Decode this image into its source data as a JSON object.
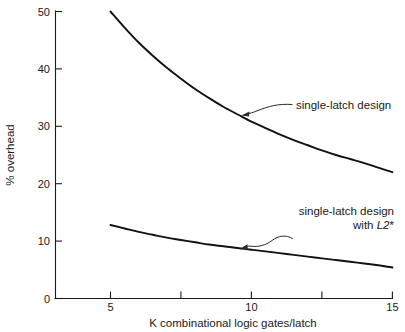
{
  "chart_data": {
    "type": "line",
    "title": "",
    "subtitle": "",
    "xlabel": "K combinational logic gates/latch",
    "ylabel": "% overhead",
    "xlim": [
      3.05,
      15
    ],
    "ylim": [
      0,
      50
    ],
    "grid": false,
    "legend_position": "inline-annotations",
    "x_ticks": [
      5,
      7.5,
      10,
      12.5,
      15
    ],
    "x_tick_labels": [
      "5",
      "",
      "10",
      "",
      "15"
    ],
    "y_ticks": [
      0,
      10,
      20,
      30,
      40,
      50
    ],
    "y_tick_labels": [
      "0",
      "10",
      "20",
      "30",
      "40",
      "50"
    ],
    "series": [
      {
        "name": "single-latch design",
        "x": [
          5,
          5.5,
          6,
          6.5,
          7,
          7.5,
          8,
          8.5,
          9,
          9.5,
          10,
          10.5,
          11,
          11.5,
          12,
          12.5,
          13,
          13.5,
          14,
          14.5,
          15
        ],
        "values": [
          50.0,
          47.2,
          44.6,
          42.3,
          40.2,
          38.3,
          36.5,
          34.9,
          33.4,
          32.1,
          30.8,
          29.7,
          28.6,
          27.6,
          26.7,
          25.8,
          25.0,
          24.3,
          23.6,
          22.8,
          22.0
        ]
      },
      {
        "name": "single-latch design with L2*",
        "x": [
          5,
          5.5,
          6,
          6.5,
          7,
          7.5,
          8,
          8.5,
          9,
          9.5,
          10,
          10.5,
          11,
          11.5,
          12,
          12.5,
          13,
          13.5,
          14,
          14.5,
          15
        ],
        "values": [
          12.8,
          12.2,
          11.6,
          11.1,
          10.6,
          10.2,
          9.8,
          9.4,
          9.1,
          8.8,
          8.5,
          8.2,
          7.9,
          7.6,
          7.3,
          7.0,
          6.7,
          6.4,
          6.1,
          5.8,
          5.4
        ]
      }
    ],
    "annotations": [
      {
        "id": "upper",
        "text": "single-latch design",
        "text_lines": [
          "single-latch design"
        ],
        "points_to": {
          "x": 9.65,
          "y": 31.5
        }
      },
      {
        "id": "lower",
        "text": "single-latch design with L2*",
        "text_lines": [
          "single-latch design",
          "with L2*"
        ],
        "line2_prefix": "with ",
        "line2_italic": "L2",
        "line2_suffix": "*",
        "points_to": {
          "x": 9.4,
          "y": 8.95
        }
      }
    ],
    "colors": {
      "line": "#111111",
      "axis": "#1a1a1a",
      "text": "#1a1a1a",
      "background": "#ffffff"
    }
  }
}
